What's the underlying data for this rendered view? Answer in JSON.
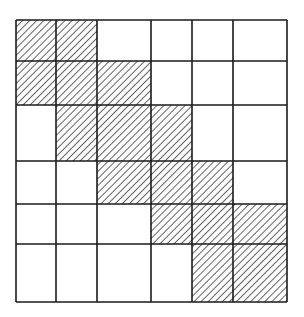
{
  "diagram": {
    "type": "banded-matrix-grid",
    "rows": 6,
    "cols": 6,
    "col_lines": [
      16,
      56,
      97,
      151,
      192,
      233,
      287
    ],
    "row_lines": [
      20,
      61,
      105,
      161,
      204,
      244,
      302
    ],
    "hatched_cells": [
      [
        0,
        0
      ],
      [
        0,
        1
      ],
      [
        1,
        0
      ],
      [
        1,
        1
      ],
      [
        1,
        2
      ],
      [
        2,
        1
      ],
      [
        2,
        2
      ],
      [
        2,
        3
      ],
      [
        3,
        2
      ],
      [
        3,
        3
      ],
      [
        3,
        4
      ],
      [
        4,
        3
      ],
      [
        4,
        4
      ],
      [
        4,
        5
      ],
      [
        5,
        4
      ],
      [
        5,
        5
      ]
    ],
    "colors": {
      "line": "#1a1a1a",
      "hatch": "#222222",
      "background": "#ffffff"
    }
  }
}
